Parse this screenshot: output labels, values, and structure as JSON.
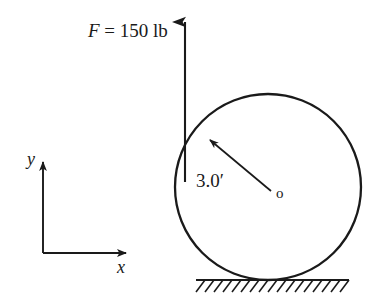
{
  "figure": {
    "type": "free-body-diagram",
    "stroke_color": "#1a1a1a",
    "background_color": "#ffffff"
  },
  "labels": {
    "force_symbol": "F",
    "force_equals": " = 150 lb",
    "force_full": "F = 150 lb",
    "force_magnitude": "150",
    "force_units": "lb",
    "radius_dimension": "3.0′",
    "radius_value": "3.0",
    "radius_units": "′",
    "center_point": "o",
    "x_axis": "x",
    "y_axis": "y"
  },
  "geometry": {
    "circle": {
      "cx": 268,
      "cy": 187,
      "r": 93
    },
    "force_arrow": {
      "x": 185,
      "y_tail": 182,
      "y_tip": 18
    },
    "radius_arrow": {
      "x1": 270,
      "y1": 190,
      "x2": 209,
      "y2": 139
    },
    "ground_line": {
      "x1": 196,
      "x2": 349,
      "y": 280
    },
    "axes": {
      "origin_x": 43,
      "origin_y": 253,
      "y_tip": 157,
      "x_tip": 131
    }
  }
}
